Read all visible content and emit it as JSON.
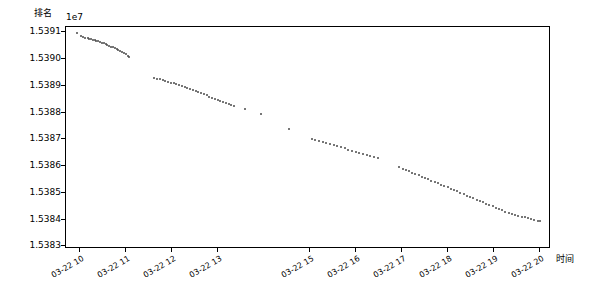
{
  "chart_data": {
    "type": "scatter",
    "title": "",
    "ylabel": "排名",
    "xlabel": "时间",
    "y_offset_text": "1e7",
    "yticks": [
      "1.5383",
      "1.5384",
      "1.5385",
      "1.5386",
      "1.5387",
      "1.5388",
      "1.5389",
      "1.5390",
      "1.5391"
    ],
    "ylim": [
      15382900,
      15391200
    ],
    "xticks": [
      "03-22 10",
      "03-22 11",
      "03-22 12",
      "03-22 13",
      "03-22 15",
      "03-22 16",
      "03-22 17",
      "03-22 18",
      "03-22 19",
      "03-22 20"
    ],
    "grid": false,
    "legend": null,
    "marker_color": "#4a4a4a",
    "series": [
      {
        "name": "排名",
        "x": [
          9.95,
          10.03,
          10.08,
          10.12,
          10.17,
          10.21,
          10.25,
          10.28,
          10.32,
          10.36,
          10.4,
          10.44,
          10.48,
          10.52,
          10.56,
          10.6,
          10.64,
          10.68,
          10.72,
          10.76,
          10.8,
          10.84,
          10.88,
          10.92,
          10.96,
          11.0,
          11.04,
          11.08,
          11.62,
          11.68,
          11.74,
          11.8,
          11.86,
          11.92,
          11.98,
          12.04,
          12.1,
          12.16,
          12.22,
          12.28,
          12.34,
          12.4,
          12.46,
          12.52,
          12.58,
          12.64,
          12.7,
          12.76,
          12.82,
          12.88,
          12.94,
          13.0,
          13.06,
          13.12,
          13.18,
          13.24,
          13.3,
          13.36,
          13.6,
          13.95,
          14.55,
          15.05,
          15.12,
          15.2,
          15.28,
          15.36,
          15.44,
          15.52,
          15.6,
          15.68,
          15.76,
          15.84,
          15.92,
          16.0,
          16.08,
          16.16,
          16.24,
          16.32,
          16.4,
          16.48,
          16.95,
          17.02,
          17.09,
          17.16,
          17.23,
          17.3,
          17.37,
          17.44,
          17.51,
          17.58,
          17.65,
          17.72,
          17.79,
          17.86,
          17.93,
          18.0,
          18.07,
          18.14,
          18.21,
          18.28,
          18.35,
          18.42,
          18.49,
          18.56,
          18.63,
          18.7,
          18.77,
          18.84,
          18.91,
          18.98,
          19.05,
          19.12,
          19.19,
          19.26,
          19.33,
          19.4,
          19.47,
          19.54,
          19.61,
          19.68,
          19.75,
          19.82,
          19.89,
          19.96,
          20.0
        ],
        "y": [
          15390980,
          15390870,
          15390830,
          15390800,
          15390780,
          15390760,
          15390740,
          15390720,
          15390700,
          15390680,
          15390660,
          15390640,
          15390610,
          15390590,
          15390560,
          15390530,
          15390500,
          15390470,
          15390440,
          15390410,
          15390380,
          15390340,
          15390300,
          15390260,
          15390220,
          15390180,
          15390130,
          15390060,
          15389300,
          15389270,
          15389240,
          15389210,
          15389180,
          15389150,
          15389120,
          15389090,
          15389060,
          15389030,
          15389000,
          15388960,
          15388920,
          15388880,
          15388840,
          15388800,
          15388760,
          15388720,
          15388680,
          15388640,
          15388600,
          15388560,
          15388520,
          15388480,
          15388440,
          15388400,
          15388360,
          15388320,
          15388280,
          15388240,
          15388150,
          15387960,
          15387380,
          15387020,
          15386980,
          15386940,
          15386900,
          15386860,
          15386820,
          15386780,
          15386740,
          15386700,
          15386660,
          15386620,
          15386580,
          15386540,
          15386500,
          15386460,
          15386420,
          15386380,
          15386340,
          15386300,
          15385950,
          15385900,
          15385850,
          15385800,
          15385750,
          15385700,
          15385650,
          15385600,
          15385550,
          15385500,
          15385450,
          15385400,
          15385350,
          15385300,
          15385250,
          15385200,
          15385150,
          15385100,
          15385050,
          15385000,
          15384950,
          15384900,
          15384850,
          15384800,
          15384750,
          15384700,
          15384650,
          15384600,
          15384550,
          15384500,
          15384450,
          15384400,
          15384350,
          15384300,
          15384250,
          15384200,
          15384170,
          15384140,
          15384110,
          15384080,
          15384050,
          15384020,
          15383990,
          15383960,
          15383940
        ]
      }
    ],
    "x_value_range": [
      9.7,
      20.25
    ]
  }
}
